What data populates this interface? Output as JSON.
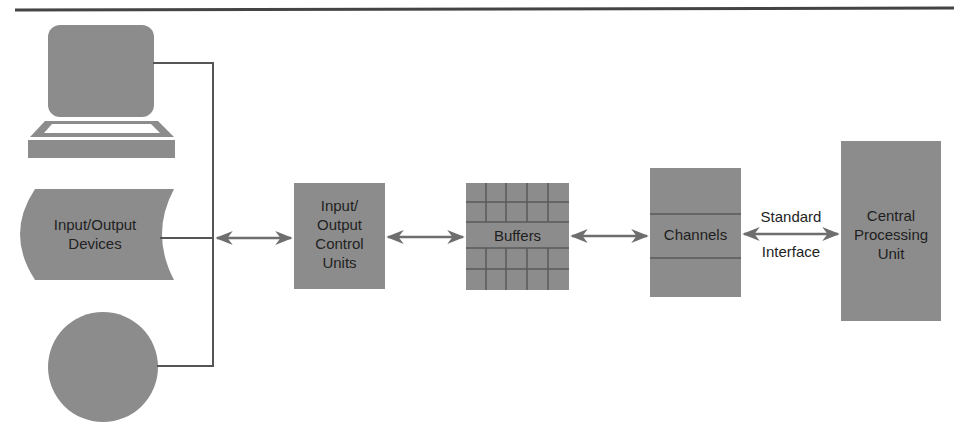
{
  "diagram": {
    "colors": {
      "box_fill": "#8c8c8c",
      "line": "#555555",
      "arrow": "#6e6e6e",
      "rule": "#444444",
      "background": "#ffffff"
    },
    "nodes": {
      "devices": {
        "label": "Input/Output\nDevices",
        "icons": [
          "terminal-icon",
          "storage-drum-icon",
          "disk-icon"
        ]
      },
      "control_units": {
        "label": "Input/\nOutput\nControl\nUnits"
      },
      "buffers": {
        "label": "Buffers"
      },
      "channels": {
        "label": "Channels"
      },
      "cpu": {
        "label": "Central\nProcessing\nUnit"
      }
    },
    "edges": [
      {
        "from": "devices",
        "to": "control_units",
        "type": "bidirectional"
      },
      {
        "from": "control_units",
        "to": "buffers",
        "type": "bidirectional"
      },
      {
        "from": "buffers",
        "to": "channels",
        "type": "bidirectional"
      },
      {
        "from": "channels",
        "to": "cpu",
        "type": "bidirectional",
        "label_top": "Standard",
        "label_bottom": "Interface"
      }
    ]
  }
}
